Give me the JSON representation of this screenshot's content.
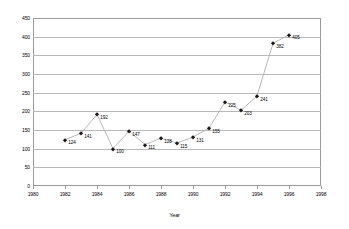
{
  "chart_data": {
    "type": "line",
    "title": "",
    "xlabel": "Year",
    "ylabel": "",
    "x": [
      1982,
      1983,
      1984,
      1985,
      1986,
      1987,
      1988,
      1989,
      1990,
      1991,
      1992,
      1993,
      1994,
      1995,
      1996
    ],
    "values": [
      124,
      141,
      192,
      100,
      147,
      111,
      128,
      115,
      131,
      155,
      225,
      203,
      241,
      382,
      405
    ],
    "point_labels": [
      "124",
      "141",
      "192",
      "100",
      "147",
      "111",
      "128",
      "115",
      "131",
      "155",
      "225",
      "203",
      "241",
      "382",
      "405"
    ],
    "xlim": [
      1980,
      1998
    ],
    "ylim": [
      0,
      450
    ],
    "xticks": [
      1980,
      1982,
      1984,
      1986,
      1988,
      1990,
      1992,
      1994,
      1996,
      1998
    ],
    "xtick_labels": [
      "1980",
      "1982",
      "1984",
      "1986",
      "1988",
      "1990",
      "1992",
      "1994",
      "1996",
      "1998"
    ],
    "yticks": [
      0,
      50,
      100,
      150,
      200,
      250,
      300,
      350,
      400,
      450
    ],
    "ytick_labels": [
      "0",
      "50",
      "100",
      "150",
      "200",
      "250",
      "300",
      "350",
      "400",
      "450"
    ],
    "grid": "horizontal",
    "legend": "none",
    "marker": "diamond",
    "line_color": "#b0b0b0",
    "marker_color": "#1a1a1a",
    "grid_color": "#b8b8b8",
    "axis_color": "#9a9a9a",
    "background": "#ffffff",
    "data_labels_shown": true
  }
}
